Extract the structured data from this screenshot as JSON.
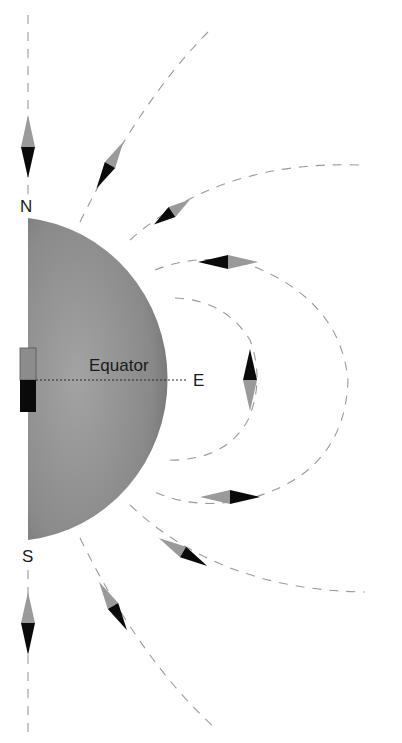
{
  "diagram": {
    "labels": {
      "north": "N",
      "south": "S",
      "east": "E",
      "equator": "Equator"
    },
    "colors": {
      "globe": "#8a8a8a",
      "globe_edge": "#6e6e6e",
      "needle_north_half": "#9a9a9a",
      "needle_south_half": "#0a0a0a",
      "field_lines": "#9a9a9a",
      "magnet_top": "#8c8c8c",
      "magnet_bottom": "#0a0a0a"
    },
    "compass_needles": [
      {
        "position": "above N pole",
        "orientation": "vertical, gray up"
      },
      {
        "position": "upper outer line",
        "orientation": "diagonal"
      },
      {
        "position": "upper middle line",
        "orientation": "diagonal"
      },
      {
        "position": "upper inner line",
        "orientation": "horizontal, gray right"
      },
      {
        "position": "east inner line",
        "orientation": "vertical, black up"
      },
      {
        "position": "lower inner line",
        "orientation": "horizontal, gray left"
      },
      {
        "position": "lower middle line",
        "orientation": "diagonal"
      },
      {
        "position": "lower outer line",
        "orientation": "diagonal"
      },
      {
        "position": "below S pole",
        "orientation": "vertical, gray up"
      }
    ]
  }
}
